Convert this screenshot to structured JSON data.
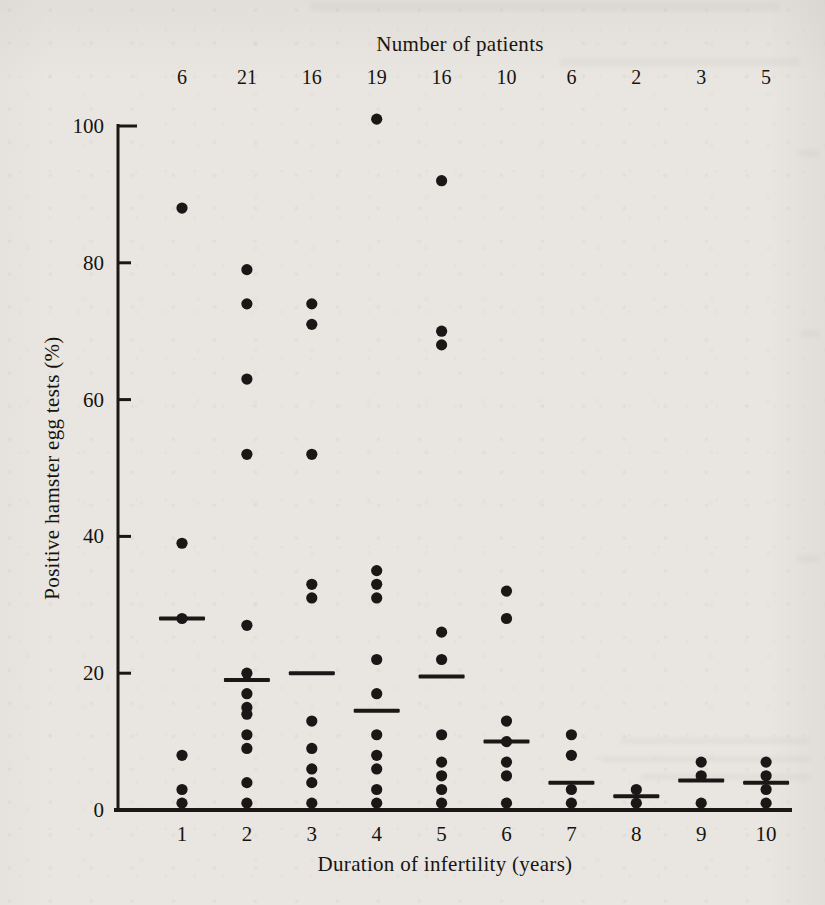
{
  "page": {
    "background_color": "#e9e6e1",
    "ink_color": "#1a1817"
  },
  "chart_data": {
    "type": "scatter",
    "top_axis_title": "Number of patients",
    "xlabel": "Duration of infertility (years)",
    "ylabel": "Positive hamster egg tests (%)",
    "ylim": [
      0,
      100
    ],
    "grid": false,
    "legend": "none",
    "y_ticks": [
      0,
      20,
      40,
      60,
      80,
      100
    ],
    "y_tick_labels": [
      "0",
      "20",
      "40",
      "60",
      "80",
      "100"
    ],
    "x_tick_labels": [
      "1",
      "2",
      "3",
      "4",
      "5",
      "6",
      "7",
      "8",
      "9",
      "10"
    ],
    "patients_per_group": [
      6,
      21,
      16,
      19,
      16,
      10,
      6,
      2,
      3,
      5
    ],
    "groups": [
      {
        "x": 1,
        "n_patients": 6,
        "values": [
          88,
          39,
          28,
          8,
          3,
          1
        ],
        "mean": 28
      },
      {
        "x": 2,
        "n_patients": 21,
        "values": [
          79,
          74,
          63,
          52,
          27,
          20,
          17,
          15,
          14,
          11,
          9,
          4,
          1
        ],
        "mean": 19
      },
      {
        "x": 3,
        "n_patients": 16,
        "values": [
          74,
          71,
          52,
          33,
          31,
          13,
          9,
          6,
          4,
          1
        ],
        "mean": 20
      },
      {
        "x": 4,
        "n_patients": 19,
        "values": [
          101,
          35,
          33,
          31,
          22,
          17,
          11,
          8,
          6,
          3,
          1
        ],
        "mean": 14.5
      },
      {
        "x": 5,
        "n_patients": 16,
        "values": [
          92,
          70,
          68,
          26,
          22,
          11,
          7,
          5,
          3,
          1
        ],
        "mean": 19.5
      },
      {
        "x": 6,
        "n_patients": 10,
        "values": [
          32,
          28,
          13,
          10,
          7,
          5,
          1
        ],
        "mean": 10
      },
      {
        "x": 7,
        "n_patients": 6,
        "values": [
          11,
          8,
          3,
          1
        ],
        "mean": 4
      },
      {
        "x": 8,
        "n_patients": 2,
        "values": [
          3,
          1
        ],
        "mean": 2
      },
      {
        "x": 9,
        "n_patients": 3,
        "values": [
          7,
          5,
          1
        ],
        "mean": 4.3
      },
      {
        "x": 10,
        "n_patients": 5,
        "values": [
          7,
          5,
          3,
          1
        ],
        "mean": 4
      }
    ],
    "mean_marker": "horizontal-bar"
  }
}
